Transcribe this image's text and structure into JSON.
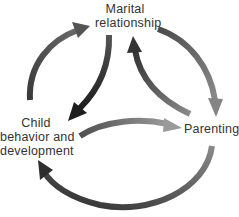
{
  "diagram": {
    "title": "",
    "nodes": [
      {
        "id": "marital",
        "lines": [
          "Marital",
          "relationship"
        ]
      },
      {
        "id": "child",
        "lines": [
          "Child",
          "behavior and",
          "development"
        ]
      },
      {
        "id": "parenting",
        "lines": [
          "Parenting"
        ]
      }
    ],
    "edges": [
      {
        "from": "child",
        "to": "marital",
        "style": "outer-arc",
        "color": "#5a5a5a"
      },
      {
        "from": "marital",
        "to": "parenting",
        "style": "outer-arc",
        "color": "#6e6e6e"
      },
      {
        "from": "parenting",
        "to": "child",
        "style": "outer-arc",
        "color": "#4a4a4a"
      },
      {
        "from": "marital",
        "to": "child",
        "style": "inner-arc",
        "color": "#333333"
      },
      {
        "from": "child",
        "to": "parenting",
        "style": "inner-arc",
        "color": "#7a7a7a"
      },
      {
        "from": "parenting",
        "to": "marital",
        "style": "inner-arc",
        "color": "#5e5e5e"
      }
    ]
  }
}
